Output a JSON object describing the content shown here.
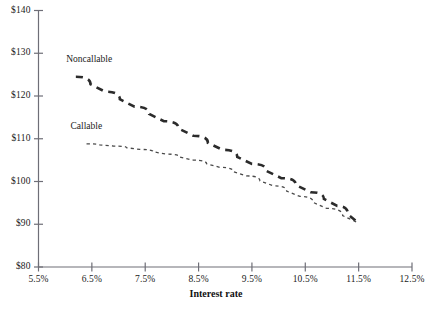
{
  "chart_data": {
    "type": "line",
    "title": "",
    "xlabel": "Interest rate",
    "ylabel": "",
    "xlim": [
      5.5,
      12.5
    ],
    "ylim": [
      80,
      140
    ],
    "grid": false,
    "legend_position": "inline-annotation",
    "x_tick_labels": [
      "5.5%",
      "6.5%",
      "7.5%",
      "8.5%",
      "9.5%",
      "10.5%",
      "11.5%",
      "12.5%"
    ],
    "x_tick_values": [
      5.5,
      6.5,
      7.5,
      8.5,
      9.5,
      10.5,
      11.5,
      12.5
    ],
    "y_tick_labels": [
      "$80",
      "$90",
      "$100",
      "$110",
      "$120",
      "$130",
      "$140"
    ],
    "y_tick_values": [
      80,
      90,
      100,
      110,
      120,
      130,
      140
    ],
    "series": [
      {
        "name": "Noncallable",
        "style": "long-dashed",
        "width": 2.6,
        "color": "#2b2b2b",
        "x": [
          6.2,
          6.75,
          7.3,
          7.85,
          8.4,
          8.95,
          9.5,
          10.05,
          10.6,
          11.1,
          11.5
        ],
        "values": [
          124.5,
          121.0,
          117.5,
          114.1,
          110.7,
          107.4,
          104.1,
          100.8,
          97.5,
          94.3,
          90.3
        ]
      },
      {
        "name": "Callable",
        "style": "short-dashed",
        "width": 1.3,
        "color": "#4a4a4a",
        "x": [
          6.4,
          6.9,
          7.4,
          7.9,
          8.4,
          8.9,
          9.4,
          9.9,
          10.4,
          10.9,
          11.5
        ],
        "values": [
          108.8,
          108.3,
          107.5,
          106.4,
          105.0,
          103.3,
          101.3,
          99.0,
          96.5,
          93.7,
          90.3
        ]
      }
    ],
    "annotations": [
      {
        "text": "Noncallable",
        "x": 6.02,
        "y": 128.2
      },
      {
        "text": "Callable",
        "x": 6.1,
        "y": 112.6
      }
    ],
    "colors": {
      "axis": "#6e6e77",
      "noncallable": "#2b2b2b",
      "callable": "#4a4a4a",
      "text": "#1a1a1a",
      "background": "#ffffff"
    }
  }
}
